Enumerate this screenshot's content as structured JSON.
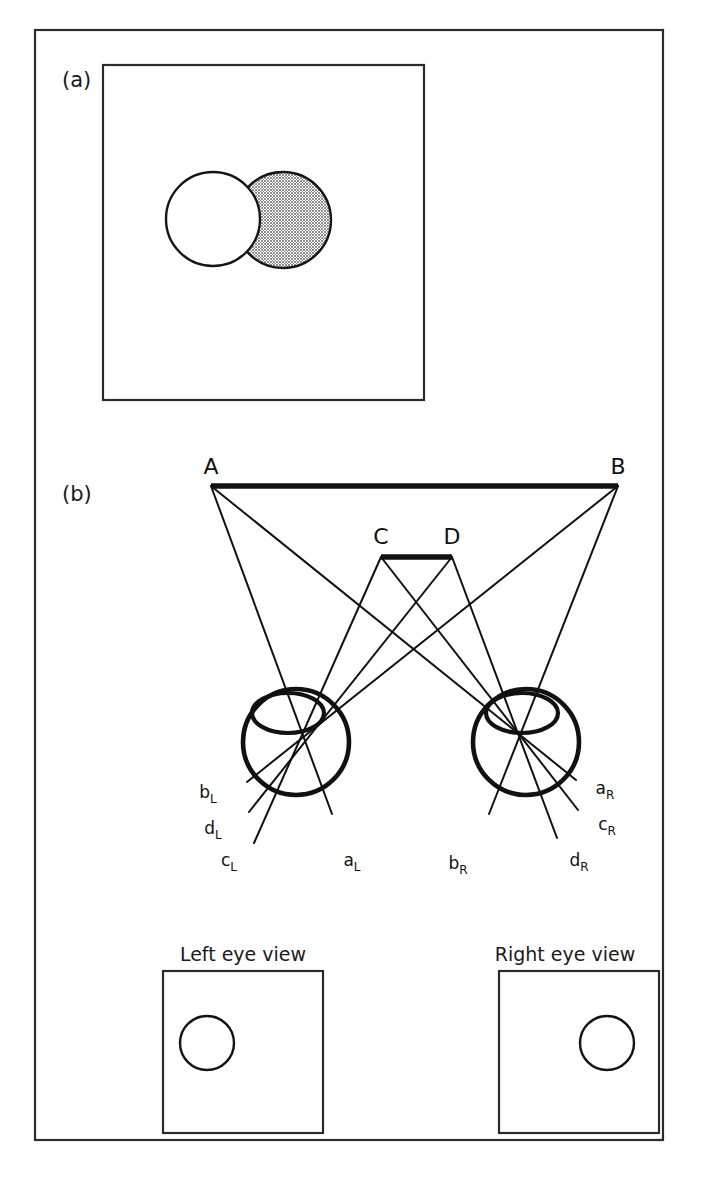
{
  "figure": {
    "panels": [
      {
        "id": "a",
        "label": "(a)"
      },
      {
        "id": "b",
        "label": "(b)"
      }
    ],
    "colors": {
      "ink": "#111111",
      "frame": "#2b2b2b",
      "shaded_disc_fill": "#9a9a9a",
      "background": "#ffffff"
    }
  },
  "panel_a": {
    "label": "(a)",
    "description": "Two overlapping discs: a white disc in front and a shaded disc behind, offset to the right.",
    "discs": [
      {
        "name": "front-white-disc",
        "fill": "#ffffff",
        "cx": 213,
        "cy": 219,
        "r": 47
      },
      {
        "name": "back-shaded-disc",
        "fill": "#9a9a9a",
        "cx": 283,
        "cy": 220,
        "r": 48
      }
    ],
    "box": {
      "x": 103,
      "y": 65,
      "width": 321,
      "height": 335
    }
  },
  "panel_b": {
    "label": "(b)",
    "far_bar": {
      "name": "far-target-bar",
      "left_label": "A",
      "right_label": "B",
      "x1": 211,
      "x2": 618,
      "y": 486
    },
    "near_bar": {
      "name": "near-target-bar",
      "left_label": "C",
      "right_label": "D",
      "x1": 381,
      "x2": 452,
      "y": 557
    },
    "eyes": [
      {
        "name": "left-eye",
        "side": "L",
        "cx": 296,
        "cy": 742,
        "r": 53,
        "nodal_x": 300,
        "nodal_y": 727,
        "lens": {
          "cx": 288,
          "cy": 713,
          "rx": 36,
          "ry": 20
        },
        "retinal_labels": [
          {
            "base": "b",
            "sub": "L",
            "text": "bL",
            "x": 214,
            "y": 798
          },
          {
            "base": "d",
            "sub": "L",
            "text": "dL",
            "x": 219,
            "y": 834
          },
          {
            "base": "c",
            "sub": "L",
            "text": "cL",
            "x": 235,
            "y": 866
          },
          {
            "base": "a",
            "sub": "L",
            "text": "aL",
            "x": 358,
            "y": 866
          }
        ]
      },
      {
        "name": "right-eye",
        "side": "R",
        "cx": 526,
        "cy": 742,
        "r": 53,
        "nodal_x": 530,
        "nodal_y": 727,
        "lens": {
          "cx": 522,
          "cy": 713,
          "rx": 36,
          "ry": 20
        },
        "retinal_labels": [
          {
            "base": "a",
            "sub": "R",
            "text": "aR",
            "x": 611,
            "y": 794
          },
          {
            "base": "c",
            "sub": "R",
            "text": "cR",
            "x": 613,
            "y": 830
          },
          {
            "base": "b",
            "sub": "R",
            "text": "bR",
            "x": 464,
            "y": 869
          },
          {
            "base": "d",
            "sub": "R",
            "text": "dR",
            "x": 585,
            "y": 866
          }
        ]
      }
    ],
    "views": [
      {
        "name": "left-eye-view",
        "title": "Left eye view",
        "title_x": 243,
        "title_y": 961,
        "box": {
          "x": 163,
          "y": 971,
          "width": 160,
          "height": 162
        },
        "disc": {
          "cx": 207,
          "cy": 1043,
          "r": 27
        }
      },
      {
        "name": "right-eye-view",
        "title": "Right eye view",
        "title_x": 565,
        "title_y": 961,
        "box": {
          "x": 499,
          "y": 971,
          "width": 160,
          "height": 162
        },
        "disc": {
          "cx": 607,
          "cy": 1043,
          "r": 27
        }
      }
    ]
  },
  "outer_frame": {
    "x": 35,
    "y": 30,
    "width": 628,
    "height": 1110
  }
}
